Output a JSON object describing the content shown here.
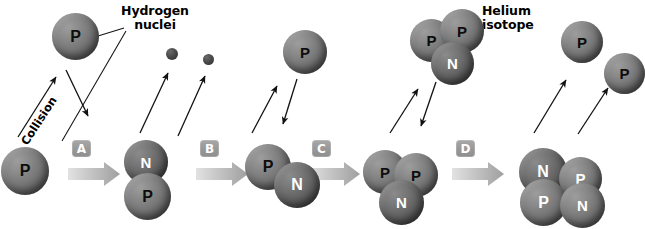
{
  "figure": {
    "labels": {
      "hydrogen_nuclei": "Hydrogen\nnuclei",
      "helium_isotope": "Helium\nisotope",
      "collision": "Collision"
    },
    "step_badges": [
      {
        "id": "badge-a",
        "label": "A"
      },
      {
        "id": "badge-b",
        "label": "B"
      },
      {
        "id": "badge-c",
        "label": "C"
      },
      {
        "id": "badge-d",
        "label": "D"
      }
    ],
    "nucleon_labels": {
      "proton": "P",
      "neutron": "N"
    },
    "colors": {
      "sphere_mid": "#757575",
      "sphere_dark": "#4a4a4a",
      "badge_gray": "#9a9a9a",
      "arrow_gray": "#b5b5b5",
      "text_black": "#000000",
      "label_white": "#ffffff",
      "background": "#ffffff"
    },
    "clusters": [
      {
        "id": "hydrogen-nucleus-top-left",
        "caption": "Hydrogen nuclei",
        "nucleons": [
          {
            "type": "proton",
            "label": "P"
          }
        ]
      },
      {
        "id": "hydrogen-nucleus-bottom-left",
        "caption": "Hydrogen nuclei",
        "nucleons": [
          {
            "type": "proton",
            "label": "P"
          }
        ]
      },
      {
        "id": "deuterium-stage-1",
        "nucleons": [
          {
            "type": "neutron",
            "label": "N"
          },
          {
            "type": "proton",
            "label": "P"
          }
        ]
      },
      {
        "id": "hydrogen-nucleus-stage-2",
        "nucleons": [
          {
            "type": "proton",
            "label": "P"
          }
        ]
      },
      {
        "id": "deuterium-stage-2",
        "nucleons": [
          {
            "type": "proton",
            "label": "P"
          },
          {
            "type": "neutron",
            "label": "N"
          }
        ]
      },
      {
        "id": "helium-3-top",
        "caption": "Helium isotope",
        "nucleons": [
          {
            "type": "proton",
            "label": "P"
          },
          {
            "type": "proton",
            "label": "P"
          },
          {
            "type": "neutron",
            "label": "N"
          }
        ]
      },
      {
        "id": "helium-3-bottom",
        "nucleons": [
          {
            "type": "proton",
            "label": "P"
          },
          {
            "type": "proton",
            "label": "P"
          },
          {
            "type": "neutron",
            "label": "N"
          }
        ]
      },
      {
        "id": "helium-4",
        "nucleons": [
          {
            "type": "neutron",
            "label": "N"
          },
          {
            "type": "proton",
            "label": "P"
          },
          {
            "type": "proton",
            "label": "P"
          },
          {
            "type": "neutron",
            "label": "N"
          }
        ]
      },
      {
        "id": "proton-emitted-upper",
        "nucleons": [
          {
            "type": "proton",
            "label": "P"
          }
        ]
      },
      {
        "id": "proton-emitted-lower",
        "nucleons": [
          {
            "type": "proton",
            "label": "P"
          }
        ]
      }
    ],
    "emitted_particles": [
      {
        "id": "particle-1"
      },
      {
        "id": "particle-2"
      }
    ]
  }
}
